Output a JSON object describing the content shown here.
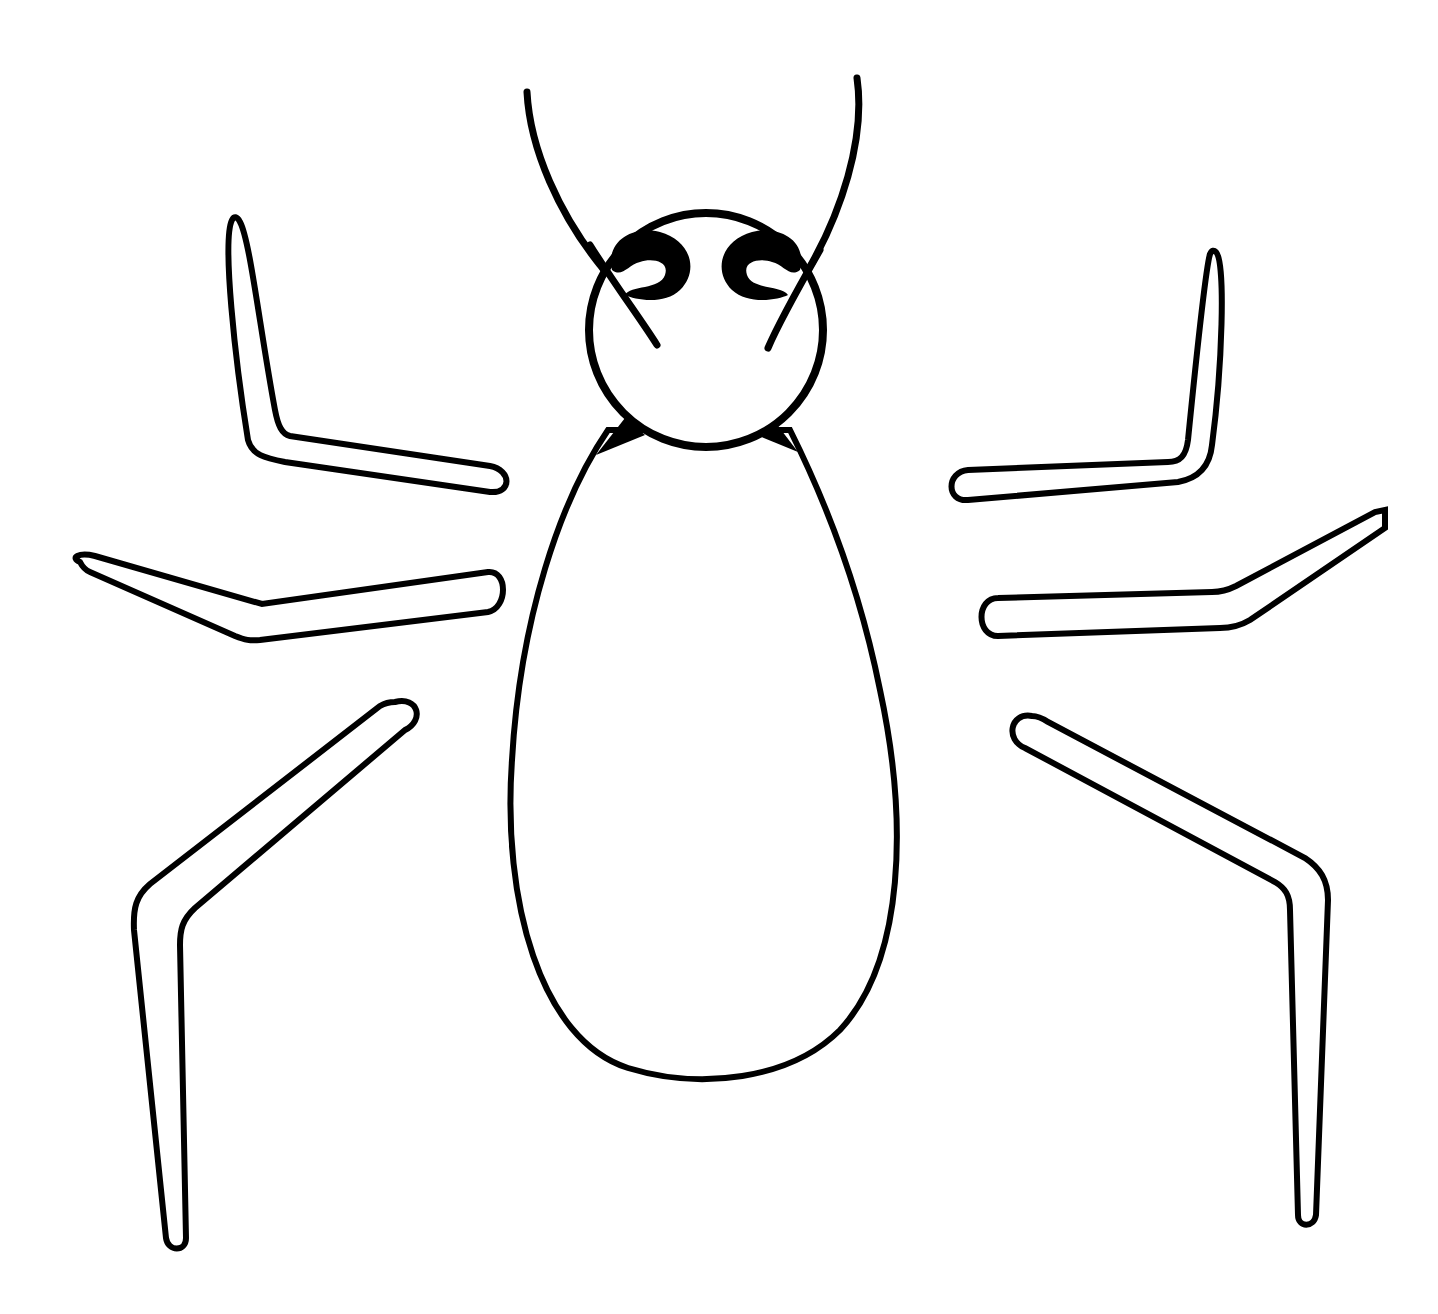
{
  "artwork": {
    "subject": "spider line drawing",
    "stroke_color": "#000000",
    "background_color": "#ffffff",
    "parts": {
      "antennae": [
        "antenna-left",
        "antenna-right"
      ],
      "head": "head-circle",
      "eyes": [
        "eye-left",
        "eye-right"
      ],
      "body": "body-teardrop",
      "legs": [
        "leg-left-1",
        "leg-left-2",
        "leg-left-3",
        "leg-right-1",
        "leg-right-2",
        "leg-right-3"
      ]
    }
  },
  "top_edge_fragment": {
    "visible": true,
    "text_left": "",
    "text_right": ""
  }
}
